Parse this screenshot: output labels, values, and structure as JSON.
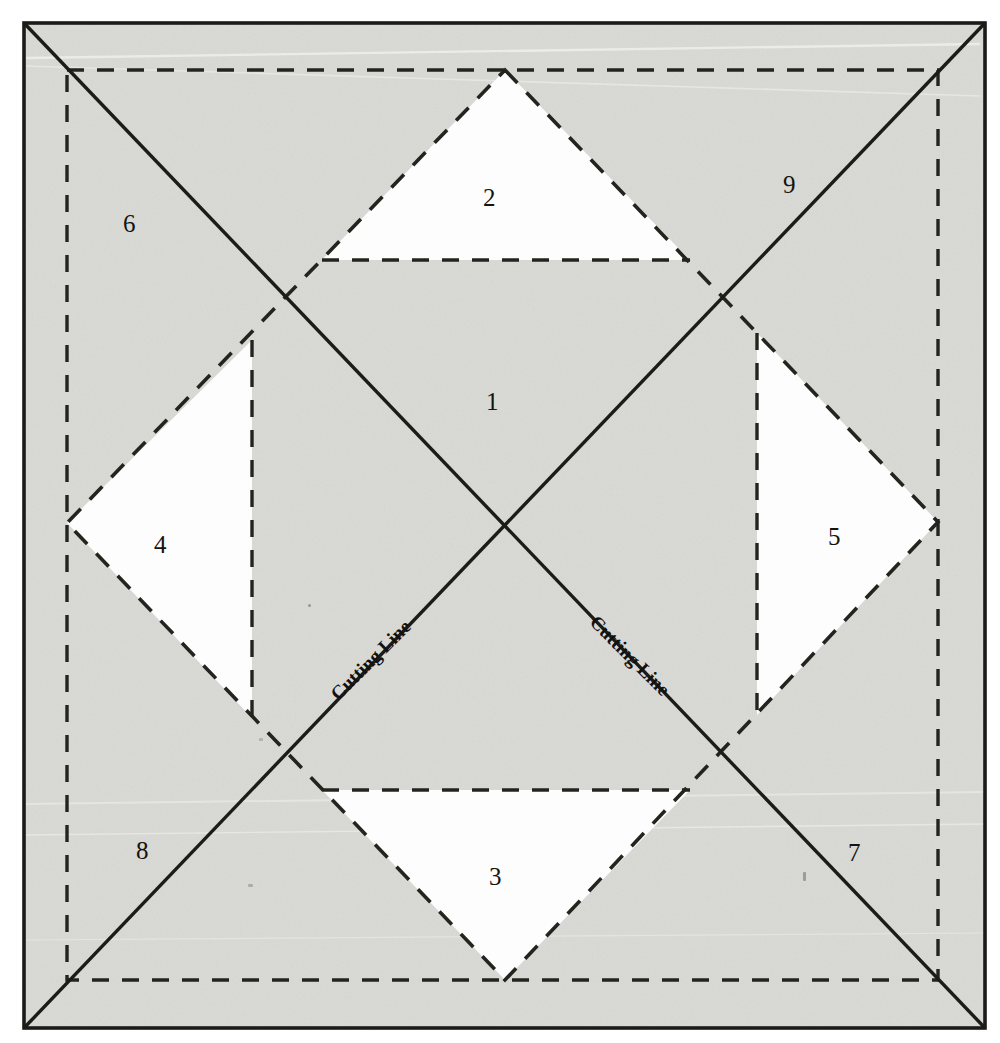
{
  "figure": {
    "type": "technical-cutting-diagram",
    "canvas": {
      "width": 1000,
      "height": 1043
    },
    "colors": {
      "paper": "#ffffff",
      "fill_shaded": "#d8d8d4",
      "fill_white": "#fdfdfd",
      "line_solid": "#1b1b18",
      "line_dashed": "#24241f",
      "text": "#141410"
    },
    "outer_border": {
      "x1": 24,
      "y1": 23,
      "x2": 985,
      "y2": 1028,
      "style": "solid"
    },
    "dashed_rect": {
      "x1": 67,
      "y1": 70,
      "x2": 938,
      "y2": 980,
      "style": "dashed"
    },
    "diamond": {
      "style": "dashed",
      "vertices": [
        {
          "name": "top",
          "x": 505,
          "y": 70
        },
        {
          "name": "right",
          "x": 938,
          "y": 522
        },
        {
          "name": "bottom",
          "x": 505,
          "y": 980
        },
        {
          "name": "left",
          "x": 67,
          "y": 523
        }
      ]
    },
    "diagonals": [
      {
        "name": "cutting-line-descending",
        "x1": 24,
        "y1": 23,
        "x2": 985,
        "y2": 1028,
        "style": "solid"
      },
      {
        "name": "cutting-line-ascending",
        "x1": 24,
        "y1": 1028,
        "x2": 985,
        "y2": 23,
        "style": "solid"
      }
    ],
    "chords": [
      {
        "name": "chord-top-horizontal",
        "x1": 322,
        "y1": 260,
        "x2": 690,
        "y2": 260,
        "style": "dashed"
      },
      {
        "name": "chord-bottom-horizontal",
        "x1": 322,
        "y1": 790,
        "x2": 690,
        "y2": 790,
        "style": "dashed"
      },
      {
        "name": "chord-left-vertical",
        "x1": 252,
        "y1": 340,
        "x2": 252,
        "y2": 718,
        "style": "dashed"
      },
      {
        "name": "chord-right-vertical",
        "x1": 757,
        "y1": 333,
        "x2": 757,
        "y2": 715,
        "style": "dashed"
      }
    ],
    "white_regions": [
      {
        "label": "2",
        "points": "505,70 690,260 322,260"
      },
      {
        "label": "3",
        "points": "505,980 322,790 690,790"
      },
      {
        "label": "4",
        "points": "67,523 252,340 252,718"
      },
      {
        "label": "5",
        "points": "938,522 757,333 757,715"
      }
    ],
    "labels": [
      {
        "id": "1",
        "text": "1",
        "x": 486,
        "y": 389
      },
      {
        "id": "2",
        "text": "2",
        "x": 483,
        "y": 185
      },
      {
        "id": "3",
        "text": "3",
        "x": 489,
        "y": 864
      },
      {
        "id": "4",
        "text": "4",
        "x": 154,
        "y": 532
      },
      {
        "id": "5",
        "text": "5",
        "x": 828,
        "y": 524
      },
      {
        "id": "6",
        "text": "6",
        "x": 123,
        "y": 211
      },
      {
        "id": "7",
        "text": "7",
        "x": 848,
        "y": 840
      },
      {
        "id": "8",
        "text": "8",
        "x": 136,
        "y": 838
      },
      {
        "id": "9",
        "text": "9",
        "x": 783,
        "y": 172
      }
    ],
    "annotations": [
      {
        "id": "cutting-line-left",
        "text": "Cutting Line",
        "x": 327,
        "y": 690,
        "rotation": -45
      },
      {
        "id": "cutting-line-right",
        "text": "Cutting Line",
        "x": 600,
        "y": 612,
        "rotation": 45
      }
    ]
  }
}
